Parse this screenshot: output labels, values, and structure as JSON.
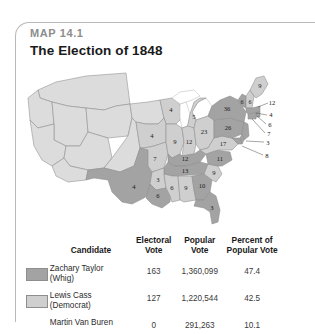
{
  "figure": {
    "map_number": "MAP 14.1",
    "title": "The Election of 1848"
  },
  "table": {
    "headers": {
      "candidate": "Candidate",
      "electoral_vote": "Electoral\nVote",
      "electoral_vote_l1": "Electoral",
      "electoral_vote_l2": "Vote",
      "popular_vote_l1": "Popular",
      "popular_vote_l2": "Vote",
      "percent_l1": "Percent of",
      "percent_l2": "Popular Vote"
    },
    "rows": [
      {
        "name_l1": "Zachary Taylor",
        "name_l2": "(Whig)",
        "electoral_vote": "163",
        "popular_vote": "1,360,099",
        "percent": "47.4",
        "swatch_color": "#a3a3a3"
      },
      {
        "name_l1": "Lewis Cass",
        "name_l2": "(Democrat)",
        "electoral_vote": "127",
        "popular_vote": "1,220,544",
        "percent": "42.5",
        "swatch_color": "#cfcfcf"
      },
      {
        "name_l1": "Martin Van Buren",
        "name_l2": "",
        "electoral_vote": "0",
        "popular_vote": "291,263",
        "percent": "10.1",
        "swatch_color": ""
      }
    ]
  },
  "map": {
    "colors": {
      "taylor": "#a3a3a3",
      "cass": "#cfcfcf",
      "territory": "#dcdcdc",
      "border": "#8b8b8b"
    },
    "electoral_labels": [
      {
        "id": "texas",
        "value": "4",
        "winner": "taylor"
      },
      {
        "id": "iowa",
        "value": "4",
        "winner": "cass"
      },
      {
        "id": "wisconsin",
        "value": "4",
        "winner": "cass"
      },
      {
        "id": "michigan",
        "value": "5",
        "winner": "cass"
      },
      {
        "id": "missouri",
        "value": "7",
        "winner": "cass"
      },
      {
        "id": "illinois",
        "value": "9",
        "winner": "cass"
      },
      {
        "id": "indiana",
        "value": "12",
        "winner": "cass"
      },
      {
        "id": "ohio",
        "value": "23",
        "winner": "cass"
      },
      {
        "id": "kentucky",
        "value": "12",
        "winner": "taylor"
      },
      {
        "id": "tennessee",
        "value": "13",
        "winner": "taylor"
      },
      {
        "id": "arkansas",
        "value": "3",
        "winner": "cass"
      },
      {
        "id": "louisiana",
        "value": "6",
        "winner": "taylor"
      },
      {
        "id": "mississippi",
        "value": "6",
        "winner": "cass"
      },
      {
        "id": "alabama",
        "value": "9",
        "winner": "cass"
      },
      {
        "id": "georgia",
        "value": "10",
        "winner": "taylor"
      },
      {
        "id": "florida",
        "value": "3",
        "winner": "taylor"
      },
      {
        "id": "south-carolina",
        "value": "9",
        "winner": "cass"
      },
      {
        "id": "north-carolina",
        "value": "11",
        "winner": "taylor"
      },
      {
        "id": "virginia",
        "value": "17",
        "winner": "cass"
      },
      {
        "id": "pennsylvania",
        "value": "26",
        "winner": "taylor"
      },
      {
        "id": "new-york",
        "value": "36",
        "winner": "taylor"
      },
      {
        "id": "vermont",
        "value": "6",
        "winner": "taylor"
      },
      {
        "id": "new-hampshire",
        "value": "6",
        "winner": "cass"
      },
      {
        "id": "maine",
        "value": "9",
        "winner": "cass"
      },
      {
        "id": "massachusetts",
        "value": "12",
        "winner": "taylor"
      },
      {
        "id": "rhode-island",
        "value": "4",
        "winner": "taylor"
      },
      {
        "id": "connecticut",
        "value": "6",
        "winner": "taylor"
      },
      {
        "id": "new-jersey",
        "value": "7",
        "winner": "taylor"
      },
      {
        "id": "delaware",
        "value": "3",
        "winner": "taylor"
      },
      {
        "id": "maryland",
        "value": "8",
        "winner": "taylor"
      }
    ],
    "callout_values": [
      "12",
      "4",
      "6",
      "7",
      "3",
      "8"
    ]
  }
}
